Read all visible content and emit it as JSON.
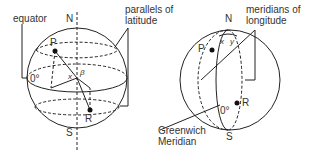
{
  "left_globe": {
    "labels": {
      "equator": "equator",
      "north": "N",
      "south": "S",
      "parallels_line1": "parallels of",
      "parallels_line2": "latitude",
      "zero": "0°",
      "point_p": "P",
      "point_r": "R",
      "angle_x": "x",
      "angle_beta": "β"
    }
  },
  "right_globe": {
    "labels": {
      "north": "N",
      "south": "S",
      "meridians_line1": "meridians of",
      "meridians_line2": "longitude",
      "greenwich_line1": "Greenwich",
      "greenwich_line2": "Meridian",
      "zero": "0°",
      "point_p": "P",
      "point_r": "R",
      "angle_x": "x",
      "angle_y": "y"
    }
  },
  "colors": {
    "ink": "#222222",
    "background": "#ffffff"
  }
}
